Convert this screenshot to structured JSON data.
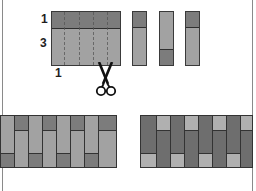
{
  "diagram": {
    "step1": {
      "labels": {
        "top_band_width": "1",
        "bottom_band_width": "3",
        "cut_width": "1"
      },
      "block": {
        "bands": [
          {
            "name": "narrow-dark-band",
            "relative_height": 1,
            "color": "#7c7c7c"
          },
          {
            "name": "wide-light-band",
            "relative_height": 3,
            "color": "#a2a2a2"
          }
        ],
        "cut_lines": 4
      },
      "tool_icon": "scissors-icon"
    },
    "step2": {
      "segments": [
        {
          "dark_position": "top"
        },
        {
          "dark_position": "bottom"
        },
        {
          "dark_position": "top"
        }
      ]
    },
    "step3": {
      "rows": [
        {
          "name": "assembled-row-left",
          "variant": "light-long-dark-short"
        },
        {
          "name": "assembled-row-right",
          "variant": "dark-long-light-short"
        }
      ]
    },
    "colors": {
      "dark_fabric": "#7c7c7c",
      "light_fabric": "#a2a2a2",
      "darker_fabric": "#6e6e6e",
      "lighter_fabric": "#b0b0b0",
      "outline": "#333333",
      "frame": "#8a8a8a"
    }
  }
}
